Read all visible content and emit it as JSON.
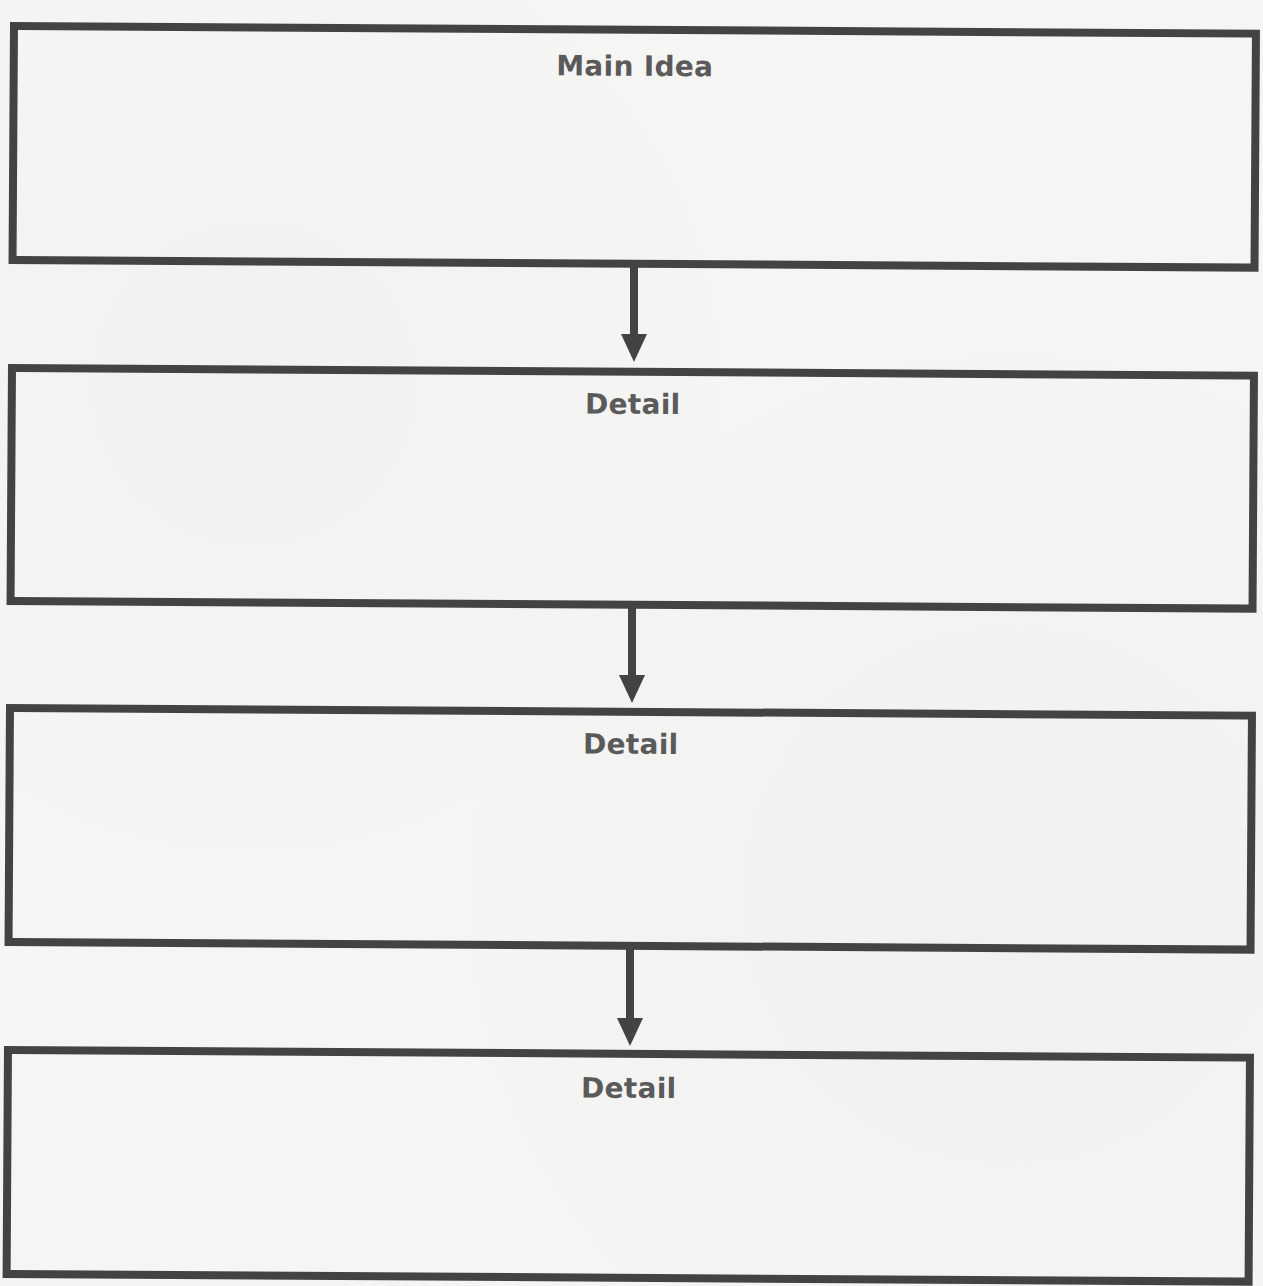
{
  "diagram": {
    "type": "vertical-flowchart",
    "border_color": "#434343",
    "text_color": "#5a5a5a",
    "boxes": [
      {
        "id": "main-idea",
        "title": "Main Idea",
        "body": ""
      },
      {
        "id": "detail-1",
        "title": "Detail",
        "body": ""
      },
      {
        "id": "detail-2",
        "title": "Detail",
        "body": ""
      },
      {
        "id": "detail-3",
        "title": "Detail",
        "body": ""
      }
    ],
    "arrows": [
      {
        "from": "main-idea",
        "to": "detail-1"
      },
      {
        "from": "detail-1",
        "to": "detail-2"
      },
      {
        "from": "detail-2",
        "to": "detail-3"
      }
    ]
  }
}
